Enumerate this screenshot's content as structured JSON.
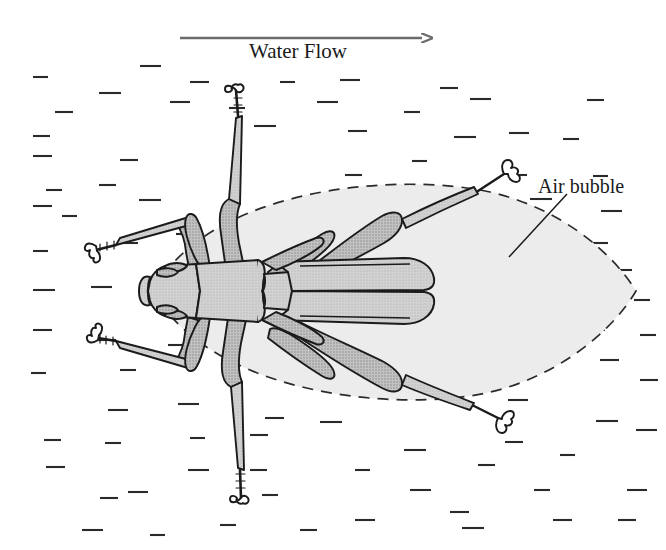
{
  "figure": {
    "type": "scientific-illustration",
    "view": "dorsal",
    "background_color": "#ffffff",
    "ink_color": "#1b1b1b",
    "body_fill_color": "#cbcbcb",
    "bubble_fill_color": "#ececec",
    "arrow_color": "#6b6b6b",
    "water_dash_color": "#2a2a2a"
  },
  "labels": {
    "water_flow": "Water Flow",
    "air_bubble": "Air bubble"
  },
  "annotations": {
    "flow_arrow": {
      "name": "flow-arrow",
      "direction": "right",
      "x_start": 180,
      "x_end": 434,
      "y": 38
    },
    "bubble_leader": {
      "name": "air-bubble-leader-line",
      "x1": 509,
      "y1": 257,
      "x2": 567,
      "y2": 194
    }
  },
  "bubble": {
    "name": "air-bubble-outline",
    "style": "dashed-lens",
    "left_x": 153,
    "right_x": 636,
    "center_y": 291,
    "top_y": 185,
    "bottom_y": 398
  },
  "water_dashes": [
    [
      33,
      77
    ],
    [
      99,
      93
    ],
    [
      140,
      66
    ],
    [
      170,
      102
    ],
    [
      190,
      82
    ],
    [
      55,
      112
    ],
    [
      33,
      136
    ],
    [
      229,
      108
    ],
    [
      280,
      82
    ],
    [
      254,
      126
    ],
    [
      317,
      102
    ],
    [
      340,
      80
    ],
    [
      348,
      131
    ],
    [
      440,
      88
    ],
    [
      345,
      175
    ],
    [
      404,
      112
    ],
    [
      412,
      161
    ],
    [
      454,
      137
    ],
    [
      470,
      99
    ],
    [
      509,
      133
    ],
    [
      33,
      156
    ],
    [
      120,
      160
    ],
    [
      99,
      185
    ],
    [
      46,
      190
    ],
    [
      62,
      216
    ],
    [
      139,
      200
    ],
    [
      176,
      234
    ],
    [
      118,
      243
    ],
    [
      33,
      206
    ],
    [
      509,
      175
    ],
    [
      587,
      100
    ],
    [
      563,
      139
    ],
    [
      593,
      176
    ],
    [
      530,
      199
    ],
    [
      601,
      211
    ],
    [
      588,
      243
    ],
    [
      549,
      252
    ],
    [
      508,
      223
    ],
    [
      615,
      270
    ],
    [
      634,
      300
    ],
    [
      33,
      251
    ],
    [
      33,
      290
    ],
    [
      91,
      287
    ],
    [
      96,
      340
    ],
    [
      33,
      330
    ],
    [
      140,
      300
    ],
    [
      186,
      290
    ],
    [
      120,
      370
    ],
    [
      31,
      373
    ],
    [
      168,
      345
    ],
    [
      178,
      404
    ],
    [
      108,
      410
    ],
    [
      265,
      418
    ],
    [
      250,
      435
    ],
    [
      44,
      440
    ],
    [
      105,
      443
    ],
    [
      190,
      438
    ],
    [
      320,
      422
    ],
    [
      188,
      470
    ],
    [
      128,
      492
    ],
    [
      46,
      467
    ],
    [
      100,
      498
    ],
    [
      250,
      470
    ],
    [
      262,
      495
    ],
    [
      355,
      470
    ],
    [
      404,
      450
    ],
    [
      410,
      490
    ],
    [
      355,
      520
    ],
    [
      450,
      512
    ],
    [
      505,
      442
    ],
    [
      478,
      465
    ],
    [
      534,
      490
    ],
    [
      560,
      455
    ],
    [
      596,
      421
    ],
    [
      636,
      430
    ],
    [
      627,
      490
    ],
    [
      553,
      520
    ],
    [
      618,
      520
    ],
    [
      300,
      530
    ],
    [
      220,
      525
    ],
    [
      150,
      535
    ],
    [
      462,
      528
    ],
    [
      82,
      530
    ],
    [
      508,
      400
    ],
    [
      600,
      360
    ],
    [
      640,
      380
    ],
    [
      588,
      330
    ],
    [
      640,
      335
    ],
    [
      509,
      310
    ],
    [
      462,
      365
    ],
    [
      512,
      355
    ]
  ],
  "anatomy": {
    "parts": [
      "head",
      "eyes",
      "rostrum",
      "pronotum",
      "scutellum",
      "left-elytron",
      "right-elytron",
      "foreleg-upper",
      "foreleg-lower",
      "midleg-upper",
      "midleg-lower",
      "hindleg-upper",
      "hindleg-lower",
      "tarsal-claws"
    ]
  }
}
